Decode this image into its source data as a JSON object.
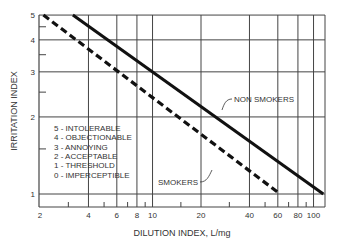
{
  "chart_data": {
    "type": "line",
    "title": "",
    "xlabel": "DILUTION INDEX, L/mg",
    "ylabel": "IRRITATION INDEX",
    "x_scale": "log",
    "y_scale": "log",
    "xlim": [
      2,
      116
    ],
    "ylim": [
      0.9,
      5
    ],
    "x_ticks": [
      2,
      4,
      6,
      8,
      10,
      20,
      40,
      60,
      80,
      100
    ],
    "x_tick_labels": [
      "2",
      "4",
      "6",
      "8",
      "10",
      "20",
      "40",
      "60",
      "80",
      "100"
    ],
    "x_minor_ticks": [
      3,
      5,
      7,
      9,
      15,
      30,
      50,
      70,
      90
    ],
    "y_ticks": [
      1,
      2,
      3,
      4,
      5
    ],
    "y_tick_labels": [
      "1",
      "2",
      "3",
      "4",
      "5"
    ],
    "y_minor_ticks": [
      1.5,
      2.5,
      3.5,
      4.5
    ],
    "grid": true,
    "series": [
      {
        "name": "NON SMOKERS",
        "style": "solid",
        "x": [
          3.2,
          115
        ],
        "y": [
          5,
          1
        ]
      },
      {
        "name": "SMOKERS",
        "style": "dashed",
        "x": [
          2.1,
          62
        ],
        "y": [
          5,
          1
        ]
      }
    ],
    "annotations": [
      {
        "text": "NON SMOKERS",
        "x": 28,
        "y": 2.1
      },
      {
        "text": "SMOKERS",
        "x": 16,
        "y": 1.35
      }
    ],
    "legend": {
      "position": "lower-left",
      "entries": [
        "5 - INTOLERABLE",
        "4 - OBJECTIONABLE",
        "3 - ANNOYING",
        "2 - ACCEPTABLE",
        "1 - THRESHOLD",
        "0 - IMPERCEPTIBLE"
      ]
    }
  },
  "colors": {
    "line": "#111111",
    "grid": "#444444",
    "text": "#333333"
  }
}
